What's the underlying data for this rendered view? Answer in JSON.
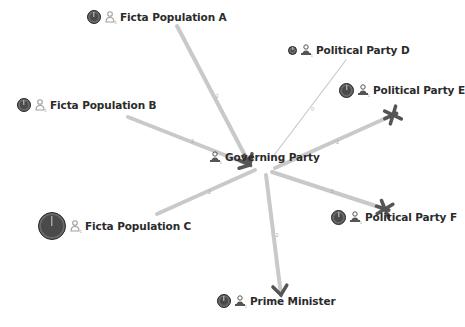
{
  "nodes": [
    {
      "id": "A",
      "label": "Ficta Population A",
      "type": "population",
      "dial_size": 14,
      "x": 87,
      "y": 17
    },
    {
      "id": "B",
      "label": "Ficta Population B",
      "type": "population",
      "dial_size": 14,
      "x": 17,
      "y": 105
    },
    {
      "id": "C",
      "label": "Ficta Population C",
      "type": "population",
      "dial_size": 28,
      "x": 38,
      "y": 226
    },
    {
      "id": "D",
      "label": "Political Party D",
      "type": "party",
      "dial_size": 9,
      "x": 288,
      "y": 50
    },
    {
      "id": "E",
      "label": "Political Party E",
      "type": "party",
      "dial_size": 15,
      "x": 339,
      "y": 90
    },
    {
      "id": "F",
      "label": "Political Party F",
      "type": "party",
      "dial_size": 15,
      "x": 331,
      "y": 217
    },
    {
      "id": "PM",
      "label": "Prime Minister",
      "type": "party",
      "dial_size": 14,
      "x": 217,
      "y": 301
    },
    {
      "id": "G",
      "label": "Governing Party",
      "type": "party",
      "dial_size": 0,
      "x": 206,
      "y": 157
    }
  ],
  "edges": [
    {
      "from": "A",
      "to": "G",
      "x1": 177,
      "y1": 26,
      "x2": 250,
      "y2": 165,
      "width": 4,
      "end": "chevron",
      "label": "2"
    },
    {
      "from": "B",
      "to": "G",
      "x1": 128,
      "y1": 117,
      "x2": 250,
      "y2": 165,
      "width": 4,
      "end": "chevron",
      "label": "2"
    },
    {
      "from": "C",
      "to": "G",
      "x1": 157,
      "y1": 214,
      "x2": 255,
      "y2": 170,
      "width": 4,
      "end": "none",
      "label": "2"
    },
    {
      "from": "D",
      "to": "G",
      "x1": 346,
      "y1": 60,
      "x2": 272,
      "y2": 158,
      "width": 1.2,
      "end": "none",
      "label": "0"
    },
    {
      "from": "G",
      "to": "E",
      "x1": 275,
      "y1": 168,
      "x2": 393,
      "y2": 115,
      "width": 4,
      "end": "cross",
      "label": "2"
    },
    {
      "from": "G",
      "to": "F",
      "x1": 272,
      "y1": 172,
      "x2": 385,
      "y2": 209,
      "width": 4,
      "end": "cross",
      "label": "2"
    },
    {
      "from": "G",
      "to": "PM",
      "x1": 266,
      "y1": 175,
      "x2": 281,
      "y2": 295,
      "width": 4,
      "end": "chevron",
      "label": "2"
    }
  ],
  "colors": {
    "edge": "#c9c9c9",
    "marker": "#555555",
    "label": "#2b2b2b",
    "dial": "#4a4a4a",
    "pictogram": "#9a9a9a"
  }
}
